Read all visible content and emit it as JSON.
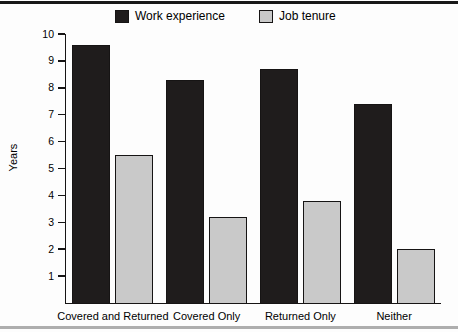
{
  "colors": {
    "background": "#fdfdfd",
    "top_rule": "#181818",
    "bottom_rule": "#aeaeae",
    "axis": "#161414",
    "text": "#000000"
  },
  "chart_data": {
    "type": "bar",
    "title": "",
    "ylabel": "Years",
    "xlabel": "",
    "categories": [
      "Covered and Returned",
      "Covered Only",
      "Returned Only",
      "Neither"
    ],
    "series": [
      {
        "name": "Work experience",
        "color": "#1f1c1c",
        "values": [
          9.6,
          8.3,
          8.7,
          7.4
        ]
      },
      {
        "name": "Job tenure",
        "color": "#c9c9c9",
        "values": [
          5.5,
          3.2,
          3.8,
          2.0
        ]
      }
    ],
    "ylim": [
      0,
      10
    ],
    "yticks": [
      1,
      2,
      3,
      4,
      5,
      6,
      7,
      8,
      9,
      10
    ],
    "grid": false,
    "legend_position": "top",
    "bar_border_color": "#161414"
  }
}
